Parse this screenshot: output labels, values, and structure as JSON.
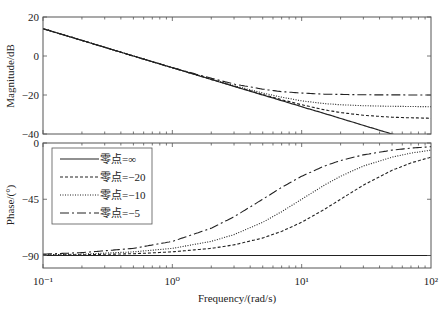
{
  "chart_data": [
    {
      "type": "line",
      "title": "",
      "xlabel": "",
      "ylabel": "Magnitude/dB",
      "xscale": "log",
      "xlim": [
        0.1,
        100
      ],
      "ylim": [
        -40,
        20
      ],
      "yticks": [
        20,
        0,
        -20,
        -40
      ],
      "ytick_labels": [
        "20",
        "0",
        "−20",
        "−40"
      ],
      "grid": false,
      "x": [
        0.1,
        0.2,
        0.5,
        1,
        2,
        3,
        5,
        7,
        10,
        15,
        20,
        30,
        50,
        70,
        100
      ],
      "series": [
        {
          "name": "零点=∞",
          "style": "solid",
          "values": [
            14,
            8,
            0,
            -6,
            -12,
            -15.6,
            -20,
            -22.9,
            -26,
            -29.5,
            -32,
            -35.6,
            -40,
            -42.9,
            -46
          ]
        },
        {
          "name": "零点=−20",
          "style": "dashed",
          "values": [
            14,
            8,
            0,
            -6,
            -12,
            -15.5,
            -19.7,
            -22.4,
            -25,
            -27.6,
            -29,
            -30.4,
            -31.4,
            -31.7,
            -31.9
          ]
        },
        {
          "name": "零点=−10",
          "style": "dotted",
          "values": [
            14,
            8,
            0,
            -6,
            -11.8,
            -15.2,
            -19,
            -21.1,
            -23,
            -24.4,
            -25,
            -25.5,
            -25.8,
            -25.9,
            -26
          ]
        },
        {
          "name": "零点=−5",
          "style": "dashdot",
          "values": [
            14,
            8,
            0,
            -6,
            -11.4,
            -14.4,
            -17,
            -18.3,
            -19,
            -19.6,
            -19.7,
            -19.9,
            -19.96,
            -19.98,
            -20
          ]
        }
      ]
    },
    {
      "type": "line",
      "title": "",
      "xlabel": "Frequency/(rad/s)",
      "ylabel": "Phase/(°)",
      "xscale": "log",
      "xlim": [
        0.1,
        100
      ],
      "ylim": [
        -100,
        0
      ],
      "yticks": [
        0,
        -45,
        -90
      ],
      "ytick_labels": [
        "0",
        "−45",
        "−90"
      ],
      "xticks": [
        0.1,
        1,
        10,
        100
      ],
      "xtick_labels": [
        "10⁻¹",
        "10⁰",
        "10¹",
        "10²"
      ],
      "grid": false,
      "legend_position": "upper left",
      "x": [
        0.1,
        0.2,
        0.5,
        1,
        2,
        3,
        5,
        7,
        10,
        15,
        20,
        30,
        50,
        70,
        100
      ],
      "series": [
        {
          "name": "零点=∞",
          "style": "solid",
          "values": [
            -90,
            -90,
            -90,
            -90,
            -90,
            -90,
            -90,
            -90,
            -90,
            -90,
            -90,
            -90,
            -90,
            -90,
            -90
          ]
        },
        {
          "name": "零点=−20",
          "style": "dashed",
          "values": [
            -89.7,
            -89.4,
            -88.6,
            -87.1,
            -84.3,
            -81.5,
            -76,
            -70.7,
            -63.4,
            -53.1,
            -45,
            -33.7,
            -21.8,
            -15.9,
            -11.3
          ]
        },
        {
          "name": "零点=−10",
          "style": "dotted",
          "values": [
            -89.4,
            -88.9,
            -87.1,
            -84.3,
            -78.7,
            -73.3,
            -63.4,
            -55,
            -45,
            -33.7,
            -26.6,
            -18.4,
            -11.3,
            -8.1,
            -5.7
          ]
        },
        {
          "name": "零点=−5",
          "style": "dashdot",
          "values": [
            -88.9,
            -87.7,
            -84.3,
            -78.7,
            -68.2,
            -59,
            -45,
            -35.5,
            -26.6,
            -18.4,
            -14,
            -9.5,
            -5.7,
            -4.1,
            -2.9
          ]
        }
      ]
    }
  ],
  "legend": {
    "entries": [
      "零点=∞",
      "零点=−20",
      "零点=−10",
      "零点=−5"
    ]
  },
  "labels": {
    "magnitude_ylabel": "Magnitude/dB",
    "phase_ylabel": "Phase/(°)",
    "xlabel": "Frequency/(rad/s)"
  }
}
